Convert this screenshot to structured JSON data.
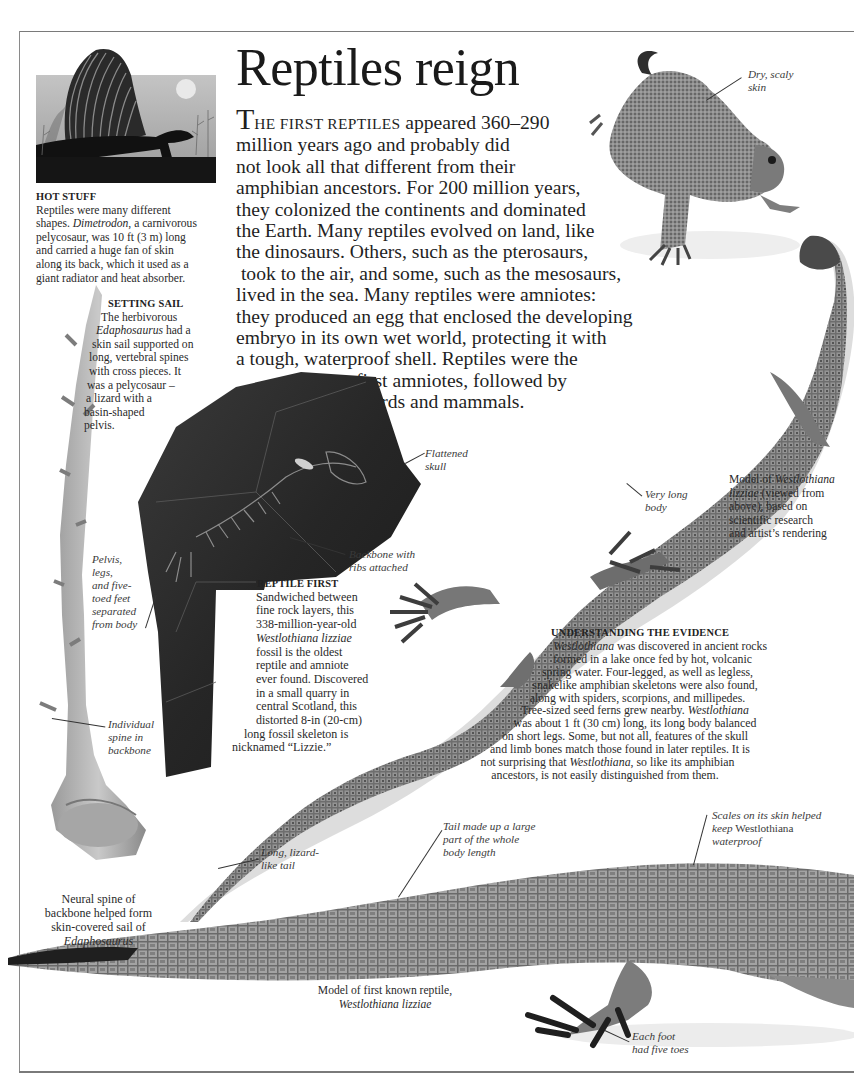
{
  "page": {
    "title": "Reptiles reign",
    "intro": {
      "dropcap": "T",
      "smallcaps": "HE FIRST REPTILES",
      "first_line_rest": " appeared 360–290",
      "lines": [
        "million years ago and probably did",
        "not look all that different from their",
        "amphibian ancestors. For 200 million years,",
        "they colonized the continents and dominated",
        "the Earth. Many reptiles evolved on land, like",
        "the dinosaurs. Others, such as the pterosaurs,",
        " took to the air, and some, such as the mesosaurs,",
        "lived in the sea. Many reptiles were amniotes:",
        "they produced an egg that enclosed the developing",
        "embryo in its own wet world, protecting it with",
        "a tough, waterproof shell. Reptiles were the",
        "first amniotes, followed by",
        "birds and mammals."
      ]
    }
  },
  "captions": {
    "hot_stuff": {
      "heading": "HOT STUFF",
      "lines": [
        "Reptiles were many different",
        "shapes. |Dimetrodon|, a carnivorous",
        "pelycosaur, was 10 ft (3 m) long",
        "and carried a huge fan of skin",
        "along its back, which it used as a",
        "giant radiator and heat absorber."
      ],
      "line1": "Reptiles were many different",
      "line2_italic": "Dimetrodon",
      "line2_rest": ", a carnivorous",
      "line2_pre": "shapes. ",
      "line3": "pelycosaur, was 10 ft (3 m) long",
      "line4": "and carried a huge fan of skin",
      "line5": "along its back, which it used as a",
      "line6": "giant radiator and heat absorber."
    },
    "setting_sail": {
      "heading": "SETTING SAIL",
      "line1": "The herbivorous",
      "line2_italic": "Edaphosaurus",
      "line2_rest": " had a",
      "line3": "skin sail supported on",
      "line4": "long, vertebral spines",
      "line5": "with cross pieces. It",
      "line6": "was a pelycosaur –",
      "line7": "a lizard with a",
      "line8": "basin-shaped",
      "line9": "pelvis."
    },
    "reptile_first": {
      "heading": "REPTILE FIRST",
      "line1": "Sandwiched between",
      "line2": "fine rock layers, this",
      "line3": "338-million-year-old",
      "line4_italic": "Westlothiana lizziae",
      "line5": "fossil is the oldest",
      "line6": "reptile and amniote",
      "line7": "ever found. Discovered",
      "line8": "in a small quarry in",
      "line9": "central Scotland, this",
      "line10": "distorted 8-in (20-cm)",
      "line11": "long fossil skeleton is",
      "line12": "nicknamed “Lizzie.”"
    },
    "evidence": {
      "heading": "UNDERSTANDING THE EVIDENCE",
      "line1_italic": "Westlothiana",
      "line1_rest": " was discovered in ancient rocks",
      "line2": "formed in a lake once fed by hot, volcanic",
      "line3": "spring water. Four-legged, as well as legless,",
      "line4": "snakelike amphibian skeletons were also found,",
      "line5": "along with spiders, scorpions, and millipedes.",
      "line6_pre": "Tree-sized seed ferns grew nearby. ",
      "line6_italic": "Westlothiana",
      "line7": "was about 1 ft (30 cm) long, its long body balanced",
      "line8": "on short legs. Some, but not all, features of the skull",
      "line9": "and limb bones match those found in later reptiles. It is",
      "line10_pre": "not surprising that ",
      "line10_italic": "Westlothiana",
      "line10_rest": ", so like its amphibian",
      "line11": "ancestors, is not easily distinguished from them."
    },
    "model_top": {
      "line1_pre": "Model of ",
      "line1_italic": "Westlothiana",
      "line2_italic": "lizziae",
      "line2_rest": " (viewed from",
      "line3": "above), based on",
      "line4": "scientific research",
      "line5": "and artist’s rendering"
    },
    "neural_spine": {
      "line1": "Neural spine of",
      "line2": "backbone helped form",
      "line3": "skin-covered sail of",
      "line4_italic": "Edaphosaurus"
    },
    "model_bottom": {
      "line1": "Model of first known reptile,",
      "line2_italic": "Westlothiana lizziae"
    }
  },
  "labels": {
    "dry_skin": [
      "Dry, scaly",
      "skin"
    ],
    "pelvis": [
      "Pelvis,",
      "legs,",
      "and five-",
      "toed feet",
      "separated",
      "from body"
    ],
    "individual_spine": [
      "Individual",
      "spine in",
      "backbone"
    ],
    "flattened_skull": [
      "Flattened",
      "skull"
    ],
    "backbone_ribs": [
      "Backbone with",
      "ribs attached"
    ],
    "very_long_body": [
      "Very long",
      "body"
    ],
    "long_tail": [
      "Long, lizard-",
      "like tail"
    ],
    "tail_large": [
      "Tail made up a large",
      "part of the whole",
      "body length"
    ],
    "scales": {
      "line1": "Scales on its skin helped",
      "line2_pre": "keep ",
      "line2_name": "Westlothiana",
      "line3": "waterproof"
    },
    "each_foot": [
      "Each foot",
      "had five toes"
    ]
  }
}
